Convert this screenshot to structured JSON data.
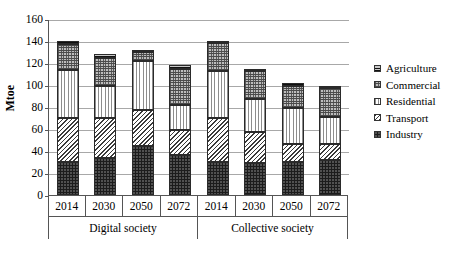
{
  "chart_data": {
    "type": "bar",
    "subtype": "stacked-bar-grouped",
    "title": "",
    "xlabel": "",
    "ylabel": "Mtoe",
    "ylim": [
      0,
      160
    ],
    "ytick_step": 20,
    "yticks": [
      "0",
      "20",
      "40",
      "60",
      "80",
      "100",
      "120",
      "140",
      "160"
    ],
    "grid": true,
    "legend_position": "right",
    "categories": [
      "2014",
      "2030",
      "2050",
      "2072",
      "2014",
      "2030",
      "2050",
      "2072"
    ],
    "groups": [
      {
        "label": "Digital society",
        "categories": [
          "2014",
          "2030",
          "2050",
          "2072"
        ]
      },
      {
        "label": "Collective society",
        "categories": [
          "2014",
          "2030",
          "2050",
          "2072"
        ]
      }
    ],
    "series": [
      {
        "name": "Industry",
        "pattern": "dense-dotted-black",
        "values": [
          30,
          34,
          45,
          36,
          30,
          29,
          30,
          32
        ]
      },
      {
        "name": "Transport",
        "pattern": "diagonal-hatch",
        "values": [
          40,
          36,
          32,
          23,
          40,
          28,
          16,
          14
        ]
      },
      {
        "name": "Residential",
        "pattern": "vertical-lines",
        "values": [
          44,
          29,
          45,
          23,
          43,
          30,
          33,
          25
        ]
      },
      {
        "name": "Commercial",
        "pattern": "fine-crosshatch",
        "values": [
          23,
          26,
          8,
          33,
          25,
          26,
          20,
          26
        ]
      },
      {
        "name": "Agriculture",
        "pattern": "coarse-crosshatch",
        "values": [
          3,
          3,
          2,
          3,
          2,
          2,
          3,
          2
        ]
      }
    ],
    "totals": [
      140,
      128,
      132,
      118,
      140,
      115,
      102,
      99
    ],
    "legend": [
      "Agriculture",
      "Commercial",
      "Residential",
      "Transport",
      "Industry"
    ]
  }
}
